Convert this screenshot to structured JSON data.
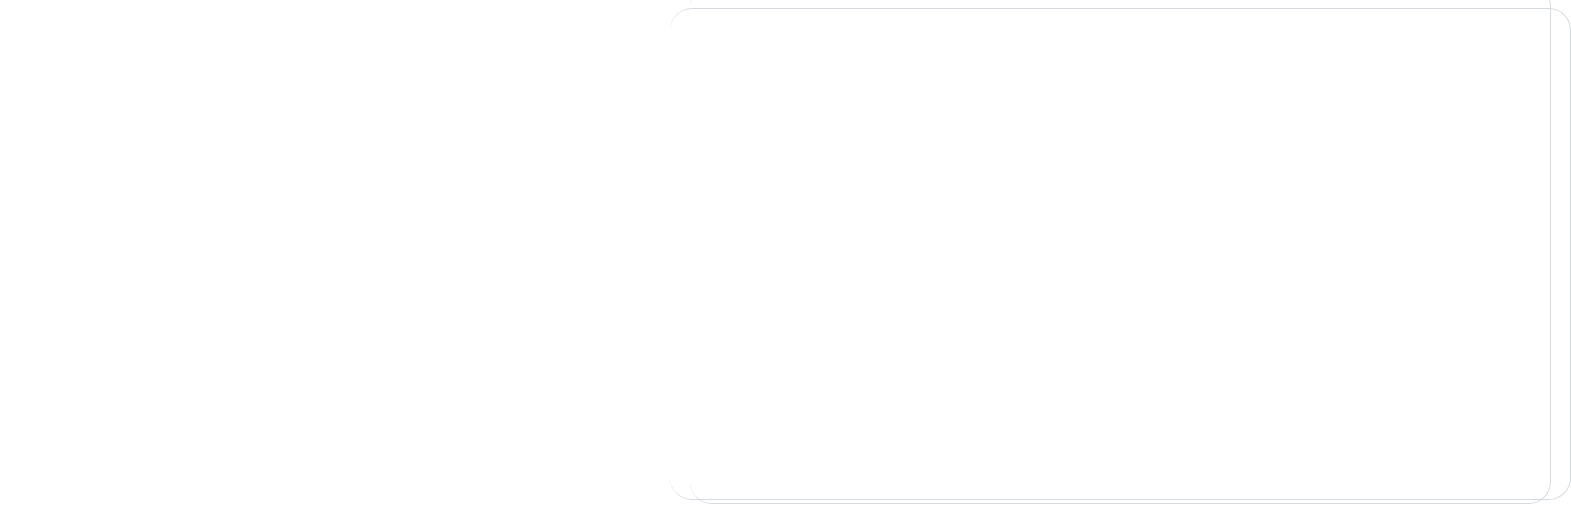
{
  "figure": {
    "background_color": "#ffffff",
    "plot_background_color": "#e8e8e8",
    "gridline_color": "#8d8d8d",
    "axis_color": "#3c3c3c",
    "marker_color": "#5d5d5d"
  },
  "chart_data": [
    {
      "type": "scatter",
      "title_prefix": "r",
      "title_equals": "=",
      "title_value": "approximately 0",
      "title": "r = approximately 0",
      "xlabel": "X",
      "ylabel": "Y",
      "xticks": [
        "0",
        "5",
        "10"
      ],
      "xtick_values": [
        0,
        5,
        10
      ],
      "yticks": [
        "0",
        "5",
        "10"
      ],
      "ytick_values": [
        0,
        5,
        10
      ],
      "xlim": [
        -0.8,
        15.0
      ],
      "ylim": [
        -1.1,
        13.4
      ],
      "grid": true,
      "legend": "none",
      "points": [
        {
          "x": 0.0,
          "y": 0.0
        },
        {
          "x": 3.0,
          "y": 1.1
        },
        {
          "x": 4.3,
          "y": 12.2
        },
        {
          "x": 10.0,
          "y": 11.6
        },
        {
          "x": 11.2,
          "y": 1.9
        },
        {
          "x": 14.0,
          "y": -0.2
        }
      ]
    },
    {
      "type": "scatter",
      "title_prefix": "r",
      "title_equals": "=",
      "title_value": "−1",
      "title": "r = −1",
      "xlabel": "X",
      "ylabel": "Y",
      "xticks": [
        "1",
        "2",
        "3",
        "4",
        "5",
        "6"
      ],
      "xtick_values": [
        1,
        2,
        3,
        4,
        5,
        6
      ],
      "yticks": [
        "12",
        "13",
        "14",
        "15",
        "16",
        "17"
      ],
      "ytick_values": [
        12,
        13,
        14,
        15,
        16,
        17
      ],
      "xlim": [
        0.72,
        6.12
      ],
      "ylim": [
        11.72,
        17.28
      ],
      "grid": true,
      "legend": "none",
      "points": [
        {
          "x": 1,
          "y": 17
        },
        {
          "x": 2,
          "y": 16
        },
        {
          "x": 3,
          "y": 15
        },
        {
          "x": 4,
          "y": 14
        },
        {
          "x": 5,
          "y": 13
        },
        {
          "x": 6,
          "y": 12
        }
      ]
    },
    {
      "type": "scatter",
      "title_prefix": "r",
      "title_equals": "=",
      "title_value": "+1",
      "title": "r = +1",
      "xlabel": "X",
      "ylabel": "Y",
      "xticks": [
        "4",
        "5",
        "6",
        "7",
        "8",
        "9"
      ],
      "xtick_values": [
        4,
        5,
        6,
        7,
        8,
        9
      ],
      "yticks": [
        "2",
        "3",
        "4",
        "5",
        "6",
        "7"
      ],
      "ytick_values": [
        2,
        3,
        4,
        5,
        6,
        7
      ],
      "xlim": [
        3.72,
        9.12
      ],
      "ylim": [
        1.72,
        7.28
      ],
      "grid": true,
      "legend": "none",
      "points": [
        {
          "x": 4,
          "y": 2
        },
        {
          "x": 5,
          "y": 3
        },
        {
          "x": 6,
          "y": 4
        },
        {
          "x": 7,
          "y": 5
        },
        {
          "x": 8,
          "y": 6
        },
        {
          "x": 9,
          "y": 7
        }
      ]
    }
  ]
}
